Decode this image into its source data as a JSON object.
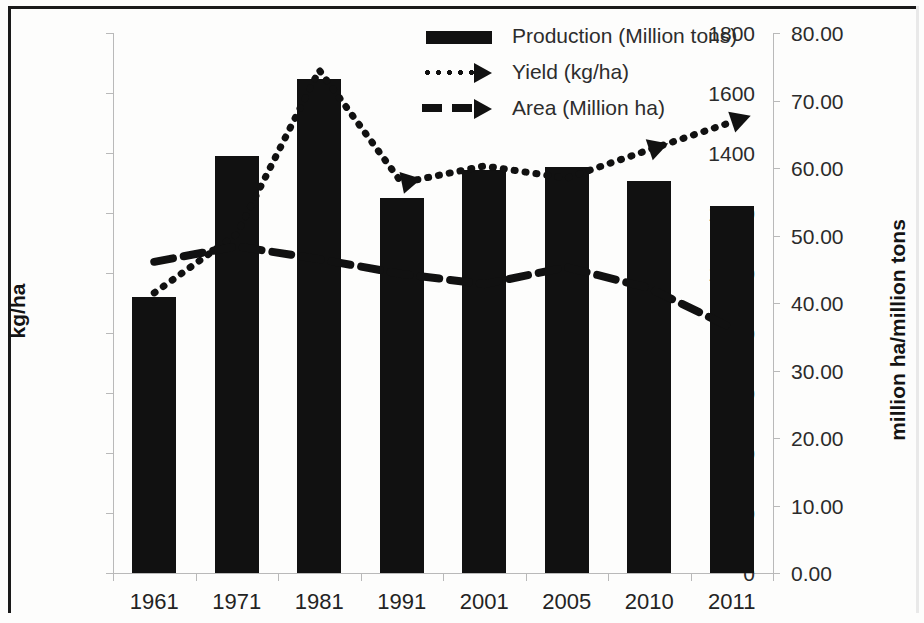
{
  "chart_data": {
    "type": "bar",
    "title": "",
    "xlabel": "",
    "ylabel": "kg/ha",
    "y2label": "million ha/million tons",
    "categories": [
      "1961",
      "1971",
      "1981",
      "1991",
      "2001",
      "2005",
      "2010",
      "2011"
    ],
    "ylim": [
      0,
      1800
    ],
    "y2lim": [
      0,
      80
    ],
    "yticks": [
      "0",
      "200",
      "400",
      "600",
      "800",
      "1000",
      "1200",
      "1400",
      "1600",
      "1800"
    ],
    "y2ticks": [
      "0.00",
      "10.00",
      "20.00",
      "30.00",
      "40.00",
      "50.00",
      "60.00",
      "70.00",
      "80.00"
    ],
    "grid": false,
    "legend_position": "top-center",
    "series": [
      {
        "name": "Production (Million tons)",
        "style": "bar",
        "axis": "left",
        "color": "#111111",
        "values": [
          920,
          1390,
          1648,
          1250,
          1343,
          1353,
          1308,
          1222
        ]
      },
      {
        "name": "Yield (kg/ha)",
        "style": "dotted-line",
        "axis": "right",
        "color": "#111111",
        "values": [
          41.5,
          50.2,
          74.5,
          57.8,
          60.3,
          58.5,
          62.7,
          66.8
        ]
      },
      {
        "name": "Area (Million ha)",
        "style": "dashed-line",
        "axis": "right",
        "color": "#111111",
        "values": [
          46.1,
          48.4,
          46.5,
          44.3,
          42.8,
          45.3,
          42.2,
          36.3
        ]
      }
    ]
  },
  "legend": {
    "items": [
      {
        "label": "Production (Million tons)",
        "key": "bar-swatch"
      },
      {
        "label": "Yield (kg/ha)",
        "key": "dotted-arrow"
      },
      {
        "label": "Area (Million ha)",
        "key": "dashed-arrow"
      }
    ]
  },
  "axes": {
    "left_title": "kg/ha",
    "right_title": "million ha/million tons"
  }
}
